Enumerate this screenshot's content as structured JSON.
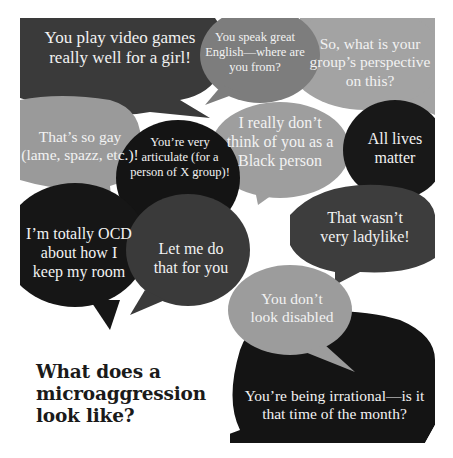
{
  "title": "What does a microaggression look like?",
  "heading": {
    "text": "What does a\nmicroaggression\nlook like?"
  },
  "colors": {
    "background": "#ffffff",
    "dark_bubble": "#1f1f1f",
    "darker_bubble": "#141414",
    "mid_dark_bubble": "#3a3a3a",
    "mid_bubble": "#7a7a7a",
    "light_bubble": "#9a9a9a",
    "lighter_bubble": "#a8a8a8",
    "bubble_text": "#f2f2f2",
    "heading_text": "#1a1a1a"
  },
  "bubbles": [
    {
      "id": "video-games",
      "text": "You play video games\nreally well for a girl!",
      "shade": "mid_dark"
    },
    {
      "id": "speak-english",
      "text": "You speak great\nEnglish—where are\nyou from?",
      "shade": "mid"
    },
    {
      "id": "group-perspective",
      "text": "So, what is your\ngroup’s perspective\non this?",
      "shade": "lighter"
    },
    {
      "id": "so-gay",
      "text": "That’s so gay\n(lame, spazz, etc.)!",
      "shade": "light"
    },
    {
      "id": "articulate",
      "text": "You’re very\narticulate (for a\nperson of X group)!",
      "shade": "darker"
    },
    {
      "id": "black-person",
      "text": "I really don’t\nthink of you as a\nBlack person",
      "shade": "light"
    },
    {
      "id": "all-lives",
      "text": "All lives\nmatter",
      "shade": "darker"
    },
    {
      "id": "ladylike",
      "text": "That wasn’t\nvery ladylike!",
      "shade": "mid_dark"
    },
    {
      "id": "ocd",
      "text": "I’m totally OCD\nabout how I\nkeep my room",
      "shade": "darker"
    },
    {
      "id": "let-me-do",
      "text": "Let me do\nthat for you",
      "shade": "mid_dark"
    },
    {
      "id": "disabled",
      "text": "You don’t\nlook disabled",
      "shade": "light"
    },
    {
      "id": "irrational",
      "text": "You’re being irrational—is it\nthat time of the month?",
      "shade": "darker"
    }
  ]
}
